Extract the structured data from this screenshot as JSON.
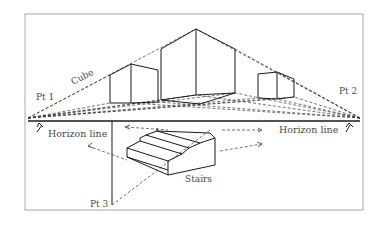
{
  "diagram": {
    "labels": {
      "pt1": "Pt 1",
      "pt2": "Pt 2",
      "pt3": "Pt 3",
      "cube": "Cube",
      "stairs": "Stairs",
      "horizon_left": "Horizon line",
      "horizon_right": "Horizon line"
    },
    "colors": {
      "frame": "#b8b8b8",
      "line": "#1a1a1a",
      "dashed": "#3a3a3a",
      "text": "#4a4a4a"
    }
  }
}
